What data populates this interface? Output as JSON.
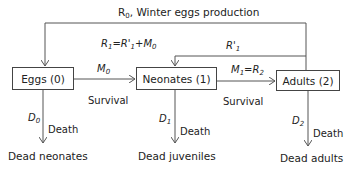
{
  "diagram": {
    "type": "flow",
    "nodes": [
      {
        "id": "eggs",
        "label": "Eggs (0)"
      },
      {
        "id": "neonates",
        "label": "Neonates (1)"
      },
      {
        "id": "adults",
        "label": "Adults (2)"
      },
      {
        "id": "dead_neonates",
        "label": "Dead neonates"
      },
      {
        "id": "dead_juveniles",
        "label": "Dead juveniles"
      },
      {
        "id": "dead_adults",
        "label": "Dead adults"
      }
    ],
    "top_feedback": {
      "symbol": "R",
      "sub": "0",
      "text": ", Winter eggs production"
    },
    "r1_formula": {
      "r": "R",
      "r_sub": "1",
      "eq": "=",
      "rp": "R'",
      "rp_sub": "1",
      "plus": "+",
      "m": "M",
      "m_sub": "0"
    },
    "r1_prime": {
      "sym": "R'",
      "sub": "1"
    },
    "m0": {
      "sym": "M",
      "sub": "0"
    },
    "m1": {
      "sym": "M",
      "sub": "1",
      "eq": "=",
      "r": "R",
      "r_sub": "2"
    },
    "survival_labels": [
      "Survival",
      "Survival"
    ],
    "death_labels": [
      "Death",
      "Death",
      "Death"
    ],
    "d_labels": [
      {
        "sym": "D",
        "sub": "0"
      },
      {
        "sym": "D",
        "sub": "1"
      },
      {
        "sym": "D",
        "sub": "2"
      }
    ],
    "line_color": "#555555"
  }
}
